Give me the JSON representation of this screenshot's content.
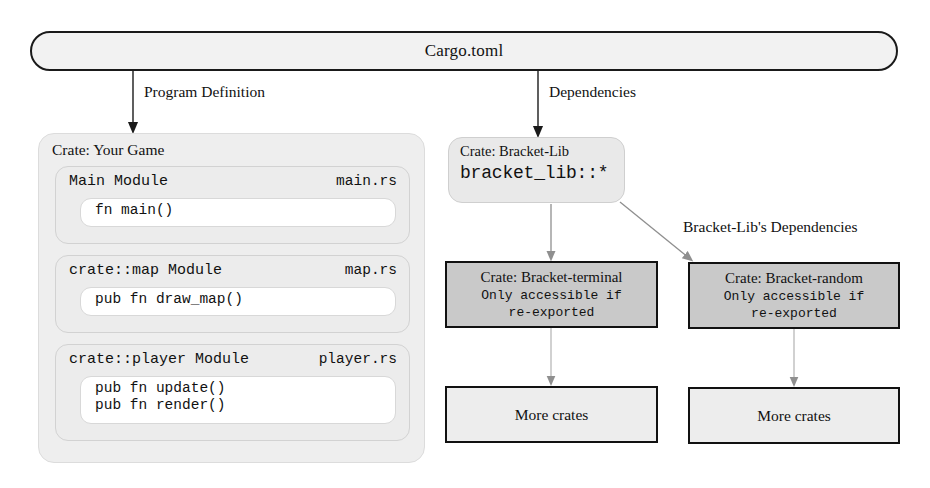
{
  "diagram": {
    "root": {
      "label": "Cargo.toml"
    },
    "edge_labels": {
      "program_definition": "Program Definition",
      "dependencies": "Dependencies",
      "lib_dependencies": "Bracket-Lib's Dependencies"
    },
    "program": {
      "group_title": "Crate: Your Game",
      "modules": [
        {
          "name": "Main Module",
          "file": "main.rs",
          "functions": [
            "fn main()"
          ]
        },
        {
          "name": "crate::map Module",
          "file": "map.rs",
          "functions": [
            "pub fn draw_map()"
          ]
        },
        {
          "name": "crate::player Module",
          "file": "player.rs",
          "functions": [
            "pub fn update()",
            "pub fn render()"
          ]
        }
      ]
    },
    "dependencies": {
      "lib": {
        "title": "Crate: Bracket-Lib",
        "path": "bracket_lib::*"
      },
      "crates": [
        {
          "title": "Crate: Bracket-terminal",
          "note_line1": "Only accessible if",
          "note_line2": "re-exported",
          "child": "More crates"
        },
        {
          "title": "Crate: Bracket-random",
          "note_line1": "Only accessible if",
          "note_line2": "re-exported",
          "child": "More crates"
        }
      ]
    },
    "colors": {
      "ink": "#111111",
      "group_fill": "#eeeeee",
      "module_fill": "#ececec",
      "fn_fill": "#ffffff",
      "dep_fill": "#c9c9c9",
      "more_fill": "#ededed",
      "arrow_light": "#9a9a9a"
    }
  }
}
